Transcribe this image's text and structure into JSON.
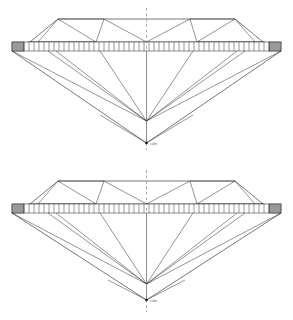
{
  "figure": {
    "background_color": "#ffffff",
    "line_color": "#1c1c1c",
    "axis_color": "#8d8d96",
    "girdle_end_color": "#9a9a9a",
    "width": 293,
    "height": 320
  },
  "diagrams": [
    {
      "id": "diamond-top",
      "name": "shallow-pavilion-brilliant",
      "label": "culet",
      "axis": {
        "x": 146.5,
        "y_top": 8,
        "y_bottom": 150,
        "style": "dashed"
      },
      "girdle": {
        "y_top": 42,
        "y_bottom": 51,
        "x_left": 12,
        "x_right": 281,
        "facet_count": 52,
        "end_block_width": 12
      },
      "crown": {
        "table_y": 19,
        "table_x_left": 58,
        "table_x_right": 235,
        "apex_y": 42,
        "bevel_left_x": 30,
        "bevel_right_x": 263
      },
      "pavilion": {
        "upper_point_x": 146.5,
        "upper_point_y": 121,
        "culet_x": 146.5,
        "culet_y": 143
      }
    },
    {
      "id": "diamond-bottom",
      "name": "deep-pavilion-brilliant",
      "label": "culet",
      "axis": {
        "x": 146.5,
        "y_top": 170,
        "y_bottom": 312,
        "style": "dashed"
      },
      "girdle": {
        "y_top": 204,
        "y_bottom": 213,
        "x_left": 12,
        "x_right": 281,
        "facet_count": 52,
        "end_block_width": 12
      },
      "crown": {
        "table_y": 181,
        "table_x_left": 58,
        "table_x_right": 235,
        "apex_y": 204,
        "bevel_left_x": 30,
        "bevel_right_x": 263
      },
      "pavilion": {
        "upper_point_x": 146.5,
        "upper_point_y": 284,
        "culet_x": 146.5,
        "culet_y": 300
      }
    }
  ]
}
